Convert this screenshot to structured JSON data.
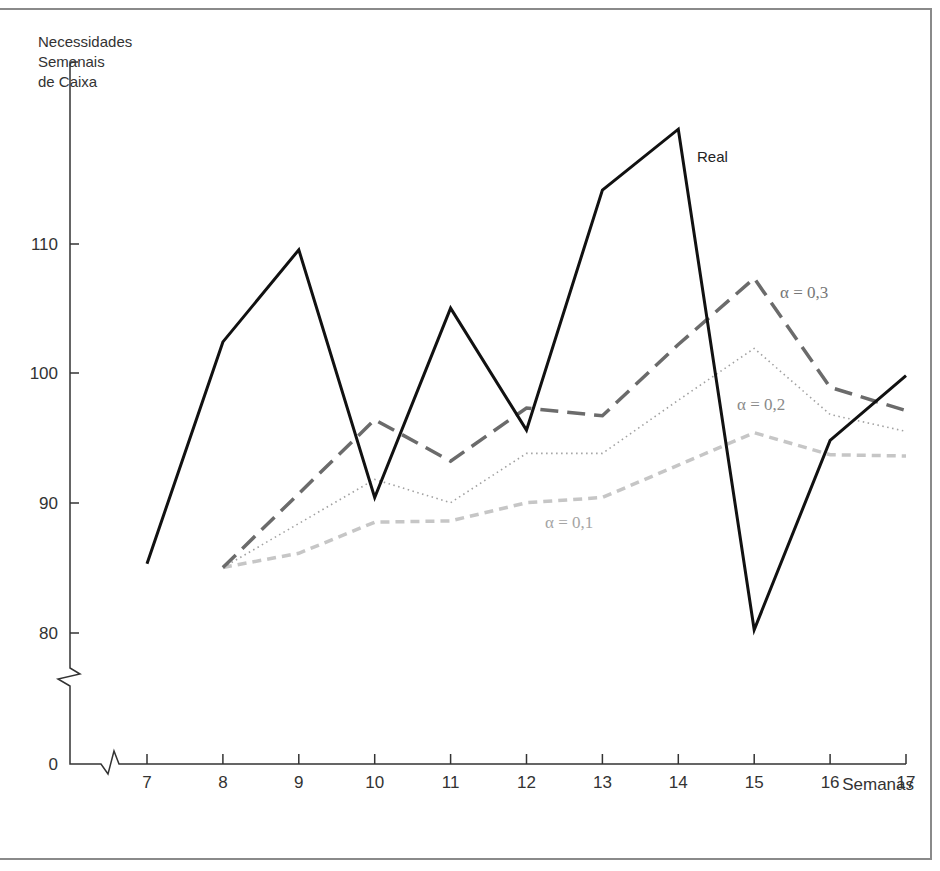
{
  "chart_data": {
    "type": "line",
    "title": "",
    "xlabel": "Semanas",
    "ylabel": "Necessidades Semanais de Caixa",
    "ylabel_lines": [
      "Necessidades",
      "Semanais",
      "de Caixa"
    ],
    "x": [
      7,
      8,
      9,
      10,
      11,
      12,
      13,
      14,
      15,
      16,
      17
    ],
    "x_ticks": [
      "7",
      "8",
      "9",
      "10",
      "11",
      "12",
      "13",
      "14",
      "15",
      "16",
      "17"
    ],
    "y_ticks": [
      "0",
      "80",
      "90",
      "100",
      "110"
    ],
    "ylim": [
      80,
      120
    ],
    "axis_break": true,
    "grid": false,
    "legend_position": "inline labels",
    "series": [
      {
        "name": "Real",
        "style": "solid",
        "color": "#111111",
        "values": [
          85.3,
          102.4,
          109.5,
          90.4,
          105.0,
          95.6,
          114.1,
          118.8,
          80.2,
          94.8,
          99.8
        ]
      },
      {
        "name": "α = 0,3",
        "style": "long-dash",
        "color": "#6b6b6b",
        "values": [
          null,
          85.0,
          90.7,
          96.4,
          93.2,
          97.3,
          96.7,
          102.2,
          107.3,
          98.9,
          97.1
        ]
      },
      {
        "name": "α = 0,2",
        "style": "dotted",
        "color": "#9a9a9a",
        "values": [
          null,
          85.0,
          88.4,
          91.8,
          90.0,
          93.8,
          93.8,
          97.9,
          101.9,
          96.8,
          95.5
        ]
      },
      {
        "name": "α = 0,1",
        "style": "short-dash",
        "color": "#c4c4c4",
        "values": [
          null,
          85.0,
          86.1,
          88.5,
          88.6,
          90.0,
          90.4,
          92.9,
          95.4,
          93.7,
          93.6
        ]
      }
    ],
    "annotations": [
      {
        "text": "Real",
        "x": 14.2,
        "y": 117
      },
      {
        "text": "α = 0,3",
        "x": 15.3,
        "y": 106.5
      },
      {
        "text": "α = 0,2",
        "x": 14.3,
        "y": 97.2
      },
      {
        "text": "α = 0,1",
        "x": 12.2,
        "y": 88.0
      }
    ]
  }
}
